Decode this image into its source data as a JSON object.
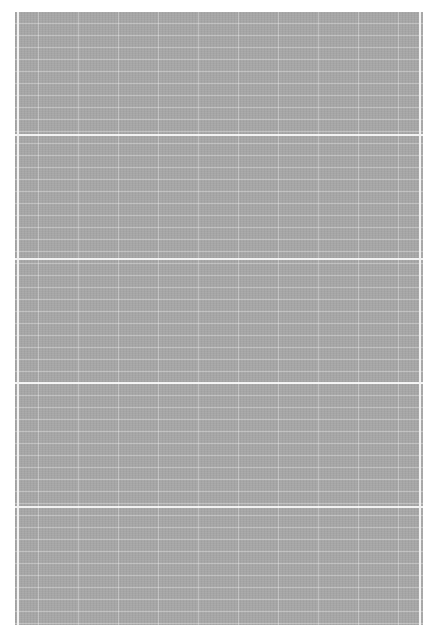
{
  "document": {
    "description": "Gray scanned grid/ledger sheet with no legible text",
    "background_color": "#ffffff",
    "sheet_color": "#a6a6a6",
    "grid_line_color": "#f2f2f2",
    "grid": {
      "minor_row_spacing_px": 12,
      "major_row_spacing_px": 120,
      "column_spacing_px": 40
    }
  }
}
